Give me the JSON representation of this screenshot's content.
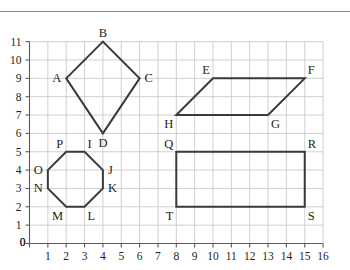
{
  "page": {
    "background_color": "#ffffff",
    "rule_color": "#8a8a8a",
    "grid_color": "#c9c9c9",
    "axis_color": "#5a5a5a",
    "shape_color": "#3a3a3a"
  },
  "chart_data": {
    "type": "scatter",
    "title": "",
    "xlabel": "",
    "ylabel": "",
    "xlim": [
      0,
      16
    ],
    "ylim": [
      0,
      11
    ],
    "grid": true,
    "legend": "none",
    "x_ticks": [
      "0",
      "1",
      "2",
      "3",
      "4",
      "5",
      "6",
      "7",
      "8",
      "9",
      "10",
      "11",
      "12",
      "13",
      "14",
      "15",
      "16"
    ],
    "y_ticks": [
      "0",
      "1",
      "2",
      "3",
      "4",
      "5",
      "6",
      "7",
      "8",
      "9",
      "10",
      "11"
    ],
    "x_tick_values": [
      0,
      1,
      2,
      3,
      4,
      5,
      6,
      7,
      8,
      9,
      10,
      11,
      12,
      13,
      14,
      15,
      16
    ],
    "y_tick_values": [
      0,
      1,
      2,
      3,
      4,
      5,
      6,
      7,
      8,
      9,
      10,
      11
    ],
    "shapes": [
      {
        "name": "kite-abcd",
        "label": "ABCD",
        "closed": true,
        "points": [
          [
            2,
            9
          ],
          [
            4,
            11
          ],
          [
            6,
            9
          ],
          [
            4,
            6
          ]
        ],
        "vertices": [
          {
            "label": "A",
            "x": 2,
            "y": 9,
            "anchor": "right"
          },
          {
            "label": "B",
            "x": 4,
            "y": 11,
            "anchor": "top"
          },
          {
            "label": "C",
            "x": 6,
            "y": 9,
            "anchor": "left"
          },
          {
            "label": "D",
            "x": 4,
            "y": 6,
            "anchor": "bottom"
          }
        ]
      },
      {
        "name": "octagon-ijklmnop",
        "label": "IJKLMNOP",
        "closed": true,
        "points": [
          [
            3,
            5
          ],
          [
            4,
            4
          ],
          [
            4,
            3
          ],
          [
            3,
            2
          ],
          [
            2,
            2
          ],
          [
            1,
            3
          ],
          [
            1,
            4
          ],
          [
            2,
            5
          ]
        ],
        "vertices": [
          {
            "label": "I",
            "x": 3,
            "y": 5,
            "anchor": "top-left"
          },
          {
            "label": "J",
            "x": 4,
            "y": 4,
            "anchor": "left"
          },
          {
            "label": "K",
            "x": 4,
            "y": 3,
            "anchor": "left"
          },
          {
            "label": "L",
            "x": 3,
            "y": 2,
            "anchor": "bottom-left"
          },
          {
            "label": "M",
            "x": 2,
            "y": 2,
            "anchor": "bottom-right"
          },
          {
            "label": "N",
            "x": 1,
            "y": 3,
            "anchor": "right"
          },
          {
            "label": "O",
            "x": 1,
            "y": 4,
            "anchor": "right"
          },
          {
            "label": "P",
            "x": 2,
            "y": 5,
            "anchor": "top-right"
          }
        ]
      },
      {
        "name": "parallelogram-efgh",
        "label": "EFGH",
        "closed": true,
        "points": [
          [
            10,
            9
          ],
          [
            15,
            9
          ],
          [
            13,
            7
          ],
          [
            8,
            7
          ]
        ],
        "vertices": [
          {
            "label": "E",
            "x": 10,
            "y": 9,
            "anchor": "top-right"
          },
          {
            "label": "F",
            "x": 15,
            "y": 9,
            "anchor": "top-left"
          },
          {
            "label": "G",
            "x": 13,
            "y": 7,
            "anchor": "bottom-left"
          },
          {
            "label": "H",
            "x": 8,
            "y": 7,
            "anchor": "bottom-right"
          }
        ]
      },
      {
        "name": "rectangle-qrst",
        "label": "QRST",
        "closed": true,
        "points": [
          [
            8,
            5
          ],
          [
            15,
            5
          ],
          [
            15,
            2
          ],
          [
            8,
            2
          ]
        ],
        "vertices": [
          {
            "label": "Q",
            "x": 8,
            "y": 5,
            "anchor": "top-right"
          },
          {
            "label": "R",
            "x": 15,
            "y": 5,
            "anchor": "top-left"
          },
          {
            "label": "S",
            "x": 15,
            "y": 2,
            "anchor": "bottom-left"
          },
          {
            "label": "T",
            "x": 8,
            "y": 2,
            "anchor": "bottom-right"
          }
        ]
      }
    ]
  }
}
